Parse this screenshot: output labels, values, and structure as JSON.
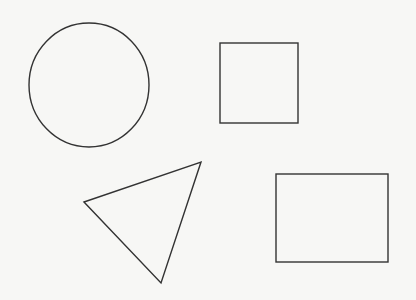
{
  "canvas": {
    "width": 416,
    "height": 300,
    "background": "#f7f7f5",
    "stroke": "#333333"
  },
  "shapes": [
    {
      "type": "circle",
      "label": "circle",
      "cx": 89,
      "cy": 85,
      "rx": 60,
      "ry": 62
    },
    {
      "type": "square",
      "label": "square",
      "x": 220,
      "y": 43,
      "width": 78,
      "height": 80
    },
    {
      "type": "triangle",
      "label": "triangle",
      "points": [
        [
          84,
          202
        ],
        [
          201,
          162
        ],
        [
          161,
          283
        ]
      ]
    },
    {
      "type": "rectangle",
      "label": "rectangle",
      "x": 276,
      "y": 174,
      "width": 112,
      "height": 88
    }
  ]
}
